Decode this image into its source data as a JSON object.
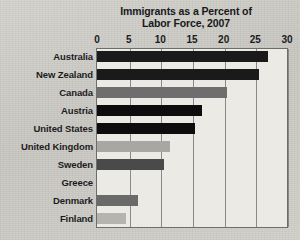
{
  "chart_data": {
    "type": "bar",
    "orientation": "horizontal",
    "title": "Immigrants as a Percent of Labor Force, 2007",
    "title_lines": [
      "Immigrants as a Percent of",
      "Labor Force, 2007"
    ],
    "xlabel": "",
    "ylabel": "",
    "xlim": [
      0,
      30
    ],
    "xticks": [
      0,
      5,
      10,
      15,
      20,
      25,
      30
    ],
    "xtick_labels": [
      "0",
      "5",
      "10",
      "15",
      "20",
      "25",
      "30"
    ],
    "grid": "vertical",
    "legend": "none",
    "categories": [
      "Australia",
      "New Zealand",
      "Canada",
      "Austria",
      "United States",
      "United Kingdom",
      "Sweden",
      "Greece",
      "Denmark",
      "Finland"
    ],
    "values": [
      27,
      25.5,
      20.5,
      16.5,
      15.5,
      11.5,
      10.5,
      0,
      6.5,
      4.5
    ],
    "bar_colors": [
      "#1a1a1a",
      "#1a1a1a",
      "#6e6e6e",
      "#0d0d0d",
      "#0d0d0d",
      "#a7a7a4",
      "#4a4a4a",
      "#eceae4",
      "#6a6a68",
      "#b5b4b0"
    ]
  },
  "figure": {
    "background_color": "#cfcdc8",
    "plot_background_color": "#eceae4",
    "frame_color": "#6e6d6a",
    "gridline_color": "#8a8986",
    "text_color": "#1a1b1d"
  }
}
